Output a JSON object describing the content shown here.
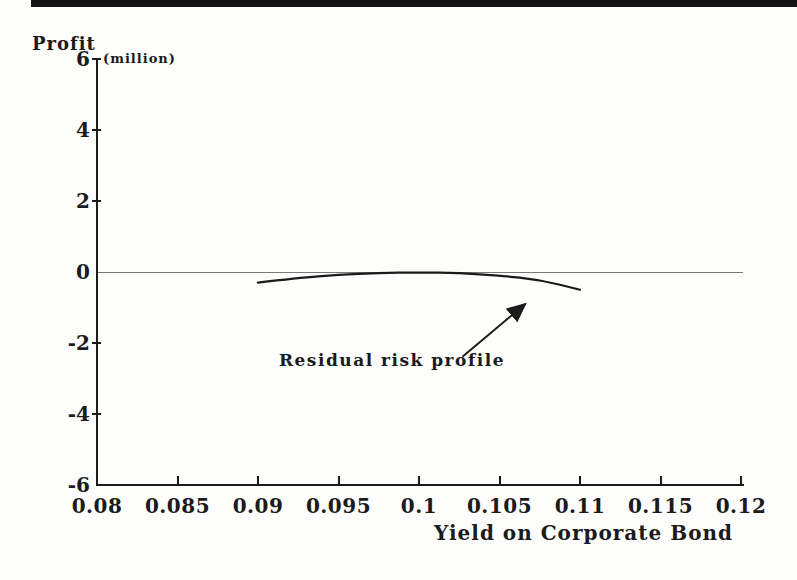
{
  "figure": {
    "colors": {
      "paper": "#fdfdfb",
      "rule": "#141414",
      "ink": "#1b1b1b",
      "zero": "#787878"
    }
  },
  "chart_data": {
    "type": "line",
    "title": "",
    "y_title": "Profit",
    "y_unit": "(million)",
    "x_title": "Yield on Corporate Bond",
    "xlim": [
      0.08,
      0.12
    ],
    "ylim": [
      -6,
      6
    ],
    "grid": false,
    "zero_line": true,
    "x_ticks": [
      {
        "v": 0.08,
        "label": "0.08"
      },
      {
        "v": 0.085,
        "label": "0.085"
      },
      {
        "v": 0.09,
        "label": "0.09"
      },
      {
        "v": 0.095,
        "label": "0.095"
      },
      {
        "v": 0.1,
        "label": "0.1"
      },
      {
        "v": 0.105,
        "label": "0.105"
      },
      {
        "v": 0.11,
        "label": "0.11"
      },
      {
        "v": 0.115,
        "label": "0.115"
      },
      {
        "v": 0.12,
        "label": "0.12"
      }
    ],
    "y_ticks": [
      {
        "v": 6,
        "label": "6"
      },
      {
        "v": 4,
        "label": "4"
      },
      {
        "v": 2,
        "label": "2"
      },
      {
        "v": 0,
        "label": "0"
      },
      {
        "v": -2,
        "label": "-2"
      },
      {
        "v": -4,
        "label": "-4"
      },
      {
        "v": -6,
        "label": "-6"
      }
    ],
    "series": [
      {
        "name": "Residual risk profile",
        "x": [
          0.09,
          0.0925,
          0.095,
          0.0975,
          0.1,
          0.1025,
          0.105,
          0.1075,
          0.11
        ],
        "y": [
          -0.3,
          -0.17,
          -0.08,
          -0.03,
          -0.01,
          -0.03,
          -0.1,
          -0.22,
          -0.5
        ]
      }
    ],
    "annotation": {
      "text": "Residual risk profile",
      "text_x": 0.0913,
      "text_y": -2.48,
      "arrow": {
        "x1": 0.1027,
        "y1": -2.39,
        "x2": 0.1066,
        "y2": -0.9
      }
    }
  }
}
